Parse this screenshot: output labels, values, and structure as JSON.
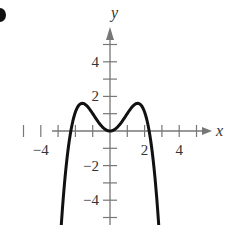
{
  "chart_data": {
    "type": "line",
    "title": "",
    "xlabel": "x",
    "ylabel": "y",
    "xlim": [
      -5.5,
      5.5
    ],
    "ylim": [
      -5.5,
      5.5
    ],
    "grid": false,
    "x_ticks": [
      -5,
      -4,
      -3,
      -2,
      -1,
      1,
      2,
      3,
      4,
      5
    ],
    "x_tick_labels": [
      {
        "value": -4,
        "label": "−4"
      },
      {
        "value": 2,
        "label": "2"
      },
      {
        "value": 4,
        "label": "4"
      }
    ],
    "y_ticks": [
      -5,
      -4,
      -3,
      -2,
      -1,
      1,
      2,
      3,
      4,
      5
    ],
    "y_tick_labels": [
      {
        "value": 4,
        "label": "4"
      },
      {
        "value": 2,
        "label": "2"
      },
      {
        "value": -2,
        "label": "−2"
      },
      {
        "value": -4,
        "label": "−4"
      }
    ],
    "series": [
      {
        "name": "f(x)",
        "description": "Even quartic-like curve: local min at (0,0), local maxima near (±1.6, 1.6), x-intercepts near ±2.6, falling steeply toward −∞",
        "x": [
          -3.1,
          -2.9,
          -2.6,
          -2.3,
          -2.0,
          -1.6,
          -1.2,
          -0.8,
          -0.4,
          0,
          0.4,
          0.8,
          1.2,
          1.6,
          2.0,
          2.3,
          2.6,
          2.9,
          3.1
        ],
        "y": [
          -6.5,
          -3.8,
          0,
          1.2,
          1.55,
          1.6,
          1.3,
          0.7,
          0.2,
          0,
          0.2,
          0.7,
          1.3,
          1.6,
          1.55,
          1.2,
          0,
          -3.8,
          -6.5
        ]
      }
    ],
    "colors": {
      "axis": "#777777",
      "curve": "#111111",
      "text": "#333333"
    }
  }
}
